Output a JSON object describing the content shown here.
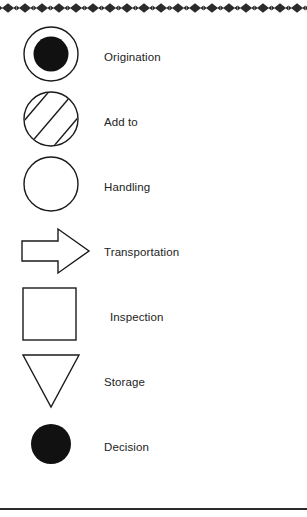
{
  "diagram": {
    "ink_color": "#1a1a1a",
    "fill_color": "#ffffff",
    "background_color": "#ffffff",
    "border": {
      "top_pattern": "diamond-chain",
      "top_pattern_color": "#2b2b2b",
      "bottom_rule_color": "#2b2b2b"
    },
    "items": [
      {
        "label": "Origination",
        "symbol": "circle-with-filled-inner-circle",
        "icon_name": "origination-symbol"
      },
      {
        "label": "Add to",
        "symbol": "circle-with-diagonal-hatching",
        "icon_name": "add-to-symbol"
      },
      {
        "label": "Handling",
        "symbol": "empty-circle",
        "icon_name": "handling-symbol"
      },
      {
        "label": "Transportation",
        "symbol": "right-block-arrow",
        "icon_name": "transportation-symbol"
      },
      {
        "label": "Inspection",
        "symbol": "square",
        "icon_name": "inspection-symbol"
      },
      {
        "label": "Storage",
        "symbol": "down-triangle",
        "icon_name": "storage-symbol"
      },
      {
        "label": "Decision",
        "symbol": "filled-circle",
        "icon_name": "decision-symbol"
      }
    ]
  }
}
